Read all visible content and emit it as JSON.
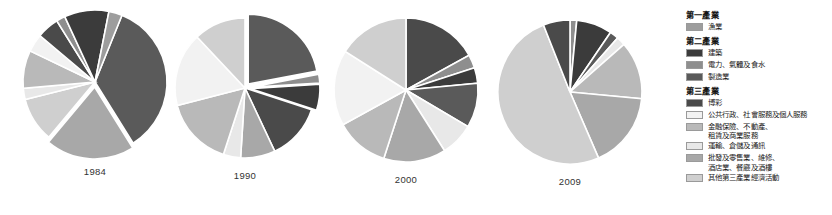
{
  "figure": {
    "title": "",
    "background": "#ffffff"
  },
  "palette": {
    "fishing": "#9d9d9d",
    "construction": "#3b3b3b",
    "utilities": "#8e8e8e",
    "manufacturing": "#5a5a5a",
    "gambling": "#4a4a4a",
    "public_admin": "#f2f2f2",
    "finance": "#b9b9b9",
    "transport": "#e8e8e8",
    "wholesale_retail": "#a8a8a8",
    "other_tertiary": "#cfcfcf"
  },
  "legend": {
    "groups": [
      {
        "title": "第一產業",
        "items": [
          {
            "label": "漁業",
            "color_key": "fishing",
            "color": "#9d9d9d"
          }
        ]
      },
      {
        "title": "第二產業",
        "items": [
          {
            "label": "建築",
            "color_key": "construction",
            "color": "#3b3b3b"
          },
          {
            "label": "電力、氣體及食水",
            "color_key": "utilities",
            "color": "#8e8e8e"
          },
          {
            "label": "製造業",
            "color_key": "manufacturing",
            "color": "#5a5a5a"
          }
        ]
      },
      {
        "title": "第三產業",
        "items": [
          {
            "label": "博彩",
            "color_key": "gambling",
            "color": "#4a4a4a"
          },
          {
            "label": "公共行政、社會服務及個人服務",
            "color_key": "public_admin",
            "color": "#f2f2f2"
          },
          {
            "label": "金融保險、不動產、\n租賃及商業服務",
            "color_key": "finance",
            "color": "#b9b9b9"
          },
          {
            "label": "運輸、倉儲及通訊",
            "color_key": "transport",
            "color": "#e8e8e8"
          },
          {
            "label": "批發及零售業、維修、\n酒店業、餐廳及酒樓",
            "color_key": "wholesale_retail",
            "color": "#a8a8a8"
          },
          {
            "label": "其他第三產業經濟活動",
            "color_key": "other_tertiary",
            "color": "#cfcfcf"
          }
        ]
      }
    ]
  },
  "chart_data": [
    {
      "type": "pie",
      "title": "1984",
      "year": "1984",
      "cx": 95,
      "cy": 82,
      "r": 72,
      "start_angle": -68,
      "categories": [
        "製造業",
        "批發及零售業、維修、酒店業、餐廳及酒樓",
        "其他第三產業經濟活動",
        "運輸、倉儲及通訊",
        "金融保險、不動產、租賃及商業服務",
        "公共行政、社會服務及個人服務",
        "博彩",
        "電力、氣體及食水",
        "建築",
        "漁業"
      ],
      "color_keys": [
        "manufacturing",
        "wholesale_retail",
        "other_tertiary",
        "transport",
        "finance",
        "public_admin",
        "gambling",
        "utilities",
        "construction",
        "fishing"
      ],
      "values": [
        35.0,
        20.0,
        10.0,
        2.5,
        8.5,
        4.0,
        5.0,
        2.0,
        10.0,
        3.0
      ],
      "exploded": [
        false,
        true,
        false,
        false,
        false,
        false,
        false,
        false,
        false,
        false
      ],
      "legend_position": "right"
    },
    {
      "type": "pie",
      "title": "1990",
      "year": "1990",
      "cx": 245,
      "cy": 88,
      "r": 70,
      "start_angle": -90,
      "categories": [
        "製造業",
        "電力、氣體及食水",
        "建築",
        "博彩",
        "批發及零售業、維修、酒店業、餐廳及酒樓",
        "運輸、倉儲及通訊",
        "金融保險、不動產、租賃及商業服務",
        "公共行政、社會服務及個人服務",
        "其他第三產業經濟活動"
      ],
      "color_keys": [
        "manufacturing",
        "utilities",
        "construction",
        "gambling",
        "wholesale_retail",
        "transport",
        "finance",
        "public_admin",
        "other_tertiary"
      ],
      "values": [
        22.0,
        2.0,
        6.0,
        13.0,
        8.0,
        4.0,
        16.0,
        17.0,
        12.0
      ],
      "exploded": [
        true,
        true,
        true,
        false,
        false,
        false,
        false,
        false,
        false
      ],
      "legend_position": "right"
    },
    {
      "type": "pie",
      "title": "2000",
      "year": "2000",
      "cx": 406,
      "cy": 90,
      "r": 72,
      "start_angle": -90,
      "categories": [
        "博彩",
        "電力、氣體及食水",
        "建築",
        "製造業",
        "運輸、倉儲及通訊",
        "批發及零售業、維修、酒店業、餐廳及酒樓",
        "金融保險、不動產、租賃及商業服務",
        "公共行政、社會服務及個人服務",
        "其他第三產業經濟活動"
      ],
      "color_keys": [
        "gambling",
        "utilities",
        "construction",
        "manufacturing",
        "transport",
        "wholesale_retail",
        "finance",
        "public_admin",
        "other_tertiary"
      ],
      "values": [
        17.0,
        3.0,
        3.5,
        10.0,
        7.5,
        14.0,
        12.0,
        17.0,
        16.0
      ],
      "exploded": [
        false,
        false,
        false,
        false,
        false,
        false,
        false,
        false,
        false
      ],
      "legend_position": "right"
    },
    {
      "type": "pie",
      "title": "2009",
      "year": "2009",
      "cx": 570,
      "cy": 92,
      "r": 72,
      "start_angle": -90,
      "categories": [
        "電力、氣體及食水",
        "建築",
        "製造業",
        "運輸、倉儲及通訊",
        "金融保險、不動產、租賃及商業服務",
        "批發及零售業、維修、酒店業、餐廳及酒樓",
        "其他第三產業經濟活動",
        "博彩"
      ],
      "color_keys": [
        "utilities",
        "construction",
        "manufacturing",
        "transport",
        "finance",
        "wholesale_retail",
        "other_tertiary",
        "gambling"
      ],
      "values": [
        1.5,
        8.0,
        2.0,
        2.0,
        13.0,
        17.0,
        50.5,
        6.0
      ],
      "exploded": [
        false,
        false,
        false,
        false,
        false,
        false,
        false,
        false
      ],
      "legend_position": "right"
    }
  ]
}
